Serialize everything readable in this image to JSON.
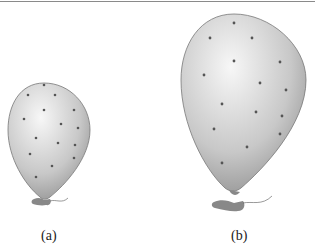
{
  "figure": {
    "panels": [
      {
        "id": "a",
        "label": "(a)",
        "description": "small inflated balloon with dots"
      },
      {
        "id": "b",
        "label": "(b)",
        "description": "larger inflated balloon with dots spread further apart"
      }
    ],
    "colors": {
      "balloon_light": "#f2f2f2",
      "balloon_dark": "#9a9a9a",
      "dot": "#555555",
      "outline": "#777777"
    }
  }
}
